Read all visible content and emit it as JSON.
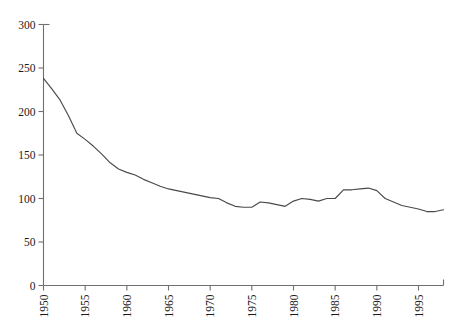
{
  "figure": {
    "top_residue_text": "",
    "background_color": "#ffffff",
    "line_color": "#4a4a4a",
    "axis_color": "#6f6f6f"
  },
  "chart_data": {
    "type": "line",
    "title": "",
    "subtitle": "",
    "xlabel": "",
    "ylabel": "",
    "xlim": [
      1950,
      1998
    ],
    "ylim": [
      0,
      300
    ],
    "grid": false,
    "legend": null,
    "x_tick_labels": [
      "1950",
      "1955",
      "1960",
      "1965",
      "1970",
      "1975",
      "1980",
      "1985",
      "1990",
      "1995"
    ],
    "x_tick_values": [
      1950,
      1955,
      1960,
      1965,
      1970,
      1975,
      1980,
      1985,
      1990,
      1995
    ],
    "x_tick_rotation": 90,
    "y_tick_labels": [
      "0",
      "50",
      "100",
      "150",
      "200",
      "250",
      "300"
    ],
    "y_tick_values": [
      0,
      50,
      100,
      150,
      200,
      250,
      300
    ],
    "series": [
      {
        "name": "series-1",
        "x": [
          1950,
          1951,
          1952,
          1953,
          1954,
          1955,
          1956,
          1957,
          1958,
          1959,
          1960,
          1961,
          1962,
          1963,
          1964,
          1965,
          1966,
          1967,
          1968,
          1969,
          1970,
          1971,
          1972,
          1973,
          1974,
          1975,
          1976,
          1977,
          1978,
          1979,
          1980,
          1981,
          1982,
          1983,
          1984,
          1985,
          1986,
          1987,
          1988,
          1989,
          1990,
          1991,
          1992,
          1993,
          1994,
          1995,
          1996,
          1997,
          1998
        ],
        "values": [
          238,
          226,
          213,
          195,
          175,
          168,
          160,
          151,
          141,
          134,
          130,
          127,
          122,
          118,
          114,
          111,
          109,
          107,
          105,
          103,
          101,
          100,
          95,
          91,
          90,
          90,
          96,
          95,
          93,
          91,
          97,
          100,
          99,
          97,
          100,
          100,
          110,
          110,
          111,
          112,
          109,
          100,
          96,
          92,
          90,
          88,
          85,
          85,
          87
        ]
      }
    ]
  }
}
